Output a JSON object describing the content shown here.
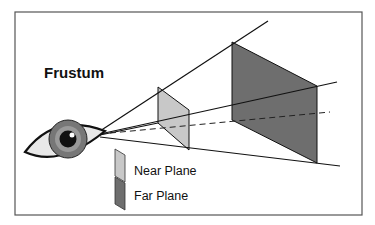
{
  "diagram": {
    "title": "Frustum",
    "legend": [
      {
        "label": "Near Plane",
        "color": "#c8c8c8"
      },
      {
        "label": "Far Plane",
        "color": "#6e6e6e"
      }
    ],
    "colors": {
      "near_plane": "#c8c8c8",
      "far_plane": "#6e6e6e",
      "frame": "#555555",
      "lines": "#111111"
    }
  }
}
